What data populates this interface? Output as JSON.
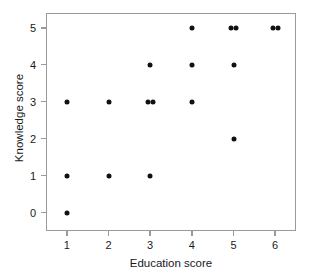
{
  "chart_data": {
    "type": "scatter",
    "title": "",
    "xlabel": "Education score",
    "ylabel": "Knowledge score",
    "xlim": [
      0.5,
      6.5
    ],
    "ylim": [
      -0.5,
      5.4
    ],
    "xticks": [
      "1",
      "2",
      "3",
      "4",
      "5",
      "6"
    ],
    "yticks": [
      "0",
      "1",
      "2",
      "3",
      "4",
      "5"
    ],
    "grid": false,
    "legend": null,
    "marker": "filled-circle",
    "marker_color": "#111111",
    "frame_color": "#9a9a9a",
    "points": [
      {
        "x": 1,
        "y": 0
      },
      {
        "x": 1,
        "y": 1
      },
      {
        "x": 1,
        "y": 3
      },
      {
        "x": 2,
        "y": 1
      },
      {
        "x": 2,
        "y": 3
      },
      {
        "x": 3,
        "y": 1
      },
      {
        "x": 3,
        "y": 3
      },
      {
        "x": 3,
        "y": 3
      },
      {
        "x": 3,
        "y": 4
      },
      {
        "x": 4,
        "y": 3
      },
      {
        "x": 4,
        "y": 4
      },
      {
        "x": 4,
        "y": 5
      },
      {
        "x": 5,
        "y": 2
      },
      {
        "x": 5,
        "y": 4
      },
      {
        "x": 5,
        "y": 5
      },
      {
        "x": 5,
        "y": 5
      },
      {
        "x": 6,
        "y": 5
      },
      {
        "x": 6,
        "y": 5
      }
    ]
  }
}
